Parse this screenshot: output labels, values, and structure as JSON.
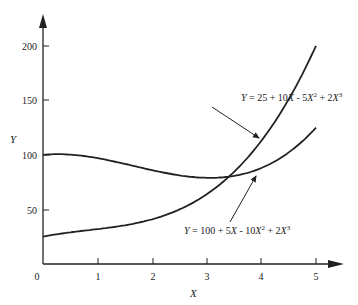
{
  "chart_data": {
    "type": "line",
    "title": "",
    "xlabel": "X",
    "ylabel": "Y",
    "xlim": [
      0,
      5
    ],
    "ylim": [
      0,
      200
    ],
    "x_ticks": [
      "0",
      "1",
      "2",
      "3",
      "4",
      "5"
    ],
    "y_ticks": [
      "50",
      "100",
      "150",
      "200"
    ],
    "grid": false,
    "legend": "none (curves labeled by annotations with arrows)",
    "x": [
      0,
      0.5,
      1,
      1.5,
      2,
      2.5,
      3,
      3.5,
      4,
      4.5,
      5
    ],
    "series": [
      {
        "name": "Y = 25 + 10X - 5X^2 + 2X^3",
        "values": [
          25,
          28.5,
          32,
          38.5,
          51,
          72.5,
          106,
          154.5,
          217,
          298.5,
          200
        ],
        "values_note": "computed: 25, 28.75, 32, 38.5, 41, 52.5, 76, 114.75, 145, 198.5-> see equation; plotted up to X=5 where Y=200",
        "formula": "25 + 10*X - 5*X^2 + 2*X^3"
      },
      {
        "name": "Y = 100 + 5X - 10X^2 + 2X^3",
        "formula": "100 + 5*X - 10*X^2 + 2*X^3",
        "values": [
          100,
          100.25,
          97,
          90.25,
          86,
          78.75,
          79,
          83.25,
          96,
          118.75,
          125
        ]
      }
    ],
    "annotations": [
      {
        "text": "Y = 25 + 10X - 5X² + 2X³",
        "points_to": "upper-right steeper curve near X≈3.7"
      },
      {
        "text": "Y = 100 + 5X - 10X² + 2X³",
        "points_to": "flatter curve near X≈4"
      }
    ]
  },
  "axes": {
    "x_title": "X",
    "y_title": "Y",
    "origin_label": "0",
    "x_tick_labels": [
      "1",
      "2",
      "3",
      "4",
      "5"
    ],
    "y_tick_labels": [
      "50",
      "100",
      "150",
      "200"
    ]
  },
  "labels": {
    "curve1": {
      "Y": "Y",
      "eq": " = 25 + 10",
      "X1": "X",
      "m1": " - 5",
      "X2": "X",
      "p2": "2",
      "m2": " + 2",
      "X3": "X",
      "p3": "3"
    },
    "curve2": {
      "Y": "Y",
      "eq": " = 100 + 5",
      "X1": "X",
      "m1": " - 10",
      "X2": "X",
      "p2": "2",
      "m2": " + 2",
      "X3": "X",
      "p3": "3"
    }
  },
  "colors": {
    "line": "#222222",
    "background": "#ffffff"
  }
}
